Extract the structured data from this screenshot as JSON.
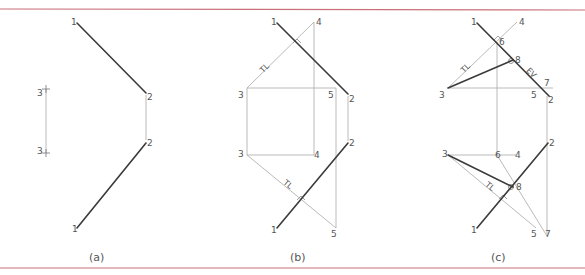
{
  "colors": {
    "border": "#c9707a",
    "object_line": "#3a3a3a",
    "construction_line": "#a8a8a8",
    "text": "#555555"
  },
  "panels": [
    {
      "caption": "(a)",
      "labels": {
        "p1_top": "1",
        "p2_top": "2",
        "p3_top": "3",
        "p3_bottom": "3",
        "p2_bottom": "2",
        "p1_bottom": "1"
      }
    },
    {
      "caption": "(b)",
      "labels": {
        "p1_top": "1",
        "p4_top": "4",
        "p3_top": "3",
        "p5_top": "5",
        "p2_top": "2",
        "p3_bottom": "3",
        "p4_bottom": "4",
        "p2_bottom": "2",
        "p1_bottom": "1",
        "p5_bottom": "5"
      },
      "notes": {
        "tl_top": "TL",
        "tl_bottom": "TL"
      }
    },
    {
      "caption": "(c)",
      "labels": {
        "p1_top": "1",
        "p4_top": "4",
        "p6_top": "6",
        "p8_top": "8",
        "p7_top": "7",
        "p3_top": "3",
        "p5_top": "5",
        "p2_top": "2",
        "p3_bottom": "3",
        "p6_bottom": "6",
        "p4_bottom": "4",
        "p2_bottom": "2",
        "p8_bottom": "8",
        "p1_bottom": "1",
        "p5_bottom": "5",
        "p7_bottom": "7"
      },
      "notes": {
        "tl_top": "TL",
        "ev_top": "EV",
        "tl_bottom": "TL"
      }
    }
  ]
}
